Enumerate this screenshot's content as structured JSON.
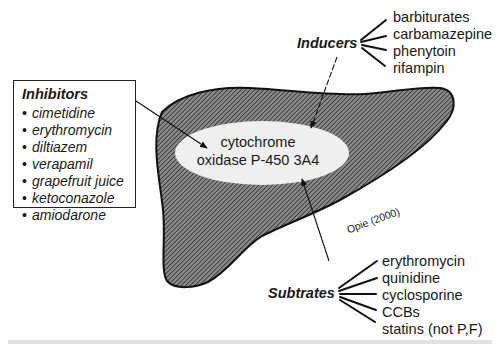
{
  "diagram": {
    "center": {
      "line1": "cytochrome",
      "line2": "oxidase P-450 3A4"
    },
    "inhibitors": {
      "heading": "Inhibitors",
      "bullet": "•",
      "items": [
        "cimetidine",
        "erythromycin",
        "diltiazem",
        "verapamil",
        "grapefruit juice",
        "ketoconazole",
        "amiodarone"
      ]
    },
    "inducers": {
      "heading": "Inducers",
      "items": [
        "barbiturates",
        "carbamazepine",
        "phenytoin",
        "rifampin"
      ]
    },
    "substrates": {
      "heading": "Subtrates",
      "items": [
        "erythromycin",
        "quinidine",
        "cyclosporine",
        "CCBs",
        "statins (not P,F)"
      ]
    },
    "citation": "Opie (2000)"
  }
}
